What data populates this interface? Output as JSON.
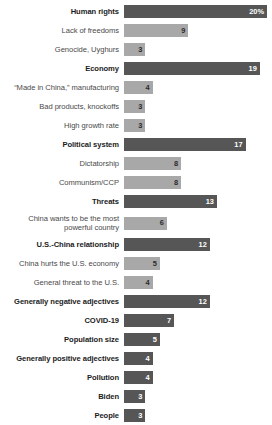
{
  "chart_data": {
    "type": "bar",
    "title": "",
    "subtitle": "",
    "xlabel": "",
    "ylabel": "",
    "orientation": "horizontal",
    "grid": false,
    "legend": null,
    "xlim": [
      0,
      20
    ],
    "value_suffix_first": "%",
    "colors": {
      "major_bar": "#565656",
      "minor_bar": "#a8a8a8",
      "major_label": "#1c1c1c",
      "minor_label": "#4a4a4a",
      "major_value_text": "#ffffff",
      "minor_value_text": "#2b2b2b",
      "background": "#ffffff"
    },
    "categories": [
      "Human rights",
      "Lack of freedoms",
      "Genocide, Uyghurs",
      "Economy",
      "“Made in China,” manufacturing",
      "Bad products, knockoffs",
      "High growth rate",
      "Political system",
      "Dictatorship",
      "Communism/CCP",
      "Threats",
      "China wants to be the most\npowerful country",
      "U.S.-China relationship",
      "China hurts the U.S. economy",
      "General threat to the U.S.",
      "Generally negative adjectives",
      "COVID-19",
      "Population size",
      "Generally positive adjectives",
      "Pollution",
      "Biden",
      "People"
    ],
    "values": [
      20,
      9,
      3,
      19,
      4,
      3,
      3,
      17,
      8,
      8,
      13,
      6,
      12,
      5,
      4,
      12,
      7,
      5,
      4,
      4,
      3,
      3
    ],
    "rows": [
      {
        "label": "Human rights",
        "value": 20,
        "display": "20%",
        "emphasis": "major",
        "tall": false
      },
      {
        "label": "Lack of freedoms",
        "value": 9,
        "display": "9",
        "emphasis": "minor",
        "tall": false
      },
      {
        "label": "Genocide, Uyghurs",
        "value": 3,
        "display": "3",
        "emphasis": "minor",
        "tall": false
      },
      {
        "label": "Economy",
        "value": 19,
        "display": "19",
        "emphasis": "major",
        "tall": false
      },
      {
        "label": "“Made in China,” manufacturing",
        "value": 4,
        "display": "4",
        "emphasis": "minor",
        "tall": false
      },
      {
        "label": "Bad products, knockoffs",
        "value": 3,
        "display": "3",
        "emphasis": "minor",
        "tall": false
      },
      {
        "label": "High growth rate",
        "value": 3,
        "display": "3",
        "emphasis": "minor",
        "tall": false
      },
      {
        "label": "Political system",
        "value": 17,
        "display": "17",
        "emphasis": "major",
        "tall": false
      },
      {
        "label": "Dictatorship",
        "value": 8,
        "display": "8",
        "emphasis": "minor",
        "tall": false
      },
      {
        "label": "Communism/CCP",
        "value": 8,
        "display": "8",
        "emphasis": "minor",
        "tall": false
      },
      {
        "label": "Threats",
        "value": 13,
        "display": "13",
        "emphasis": "major",
        "tall": false
      },
      {
        "label": "China wants to be the most\npowerful country",
        "value": 6,
        "display": "6",
        "emphasis": "minor",
        "tall": true
      },
      {
        "label": "U.S.-China relationship",
        "value": 12,
        "display": "12",
        "emphasis": "major",
        "tall": false
      },
      {
        "label": "China hurts the U.S. economy",
        "value": 5,
        "display": "5",
        "emphasis": "minor",
        "tall": false
      },
      {
        "label": "General threat to the U.S.",
        "value": 4,
        "display": "4",
        "emphasis": "minor",
        "tall": false
      },
      {
        "label": "Generally negative adjectives",
        "value": 12,
        "display": "12",
        "emphasis": "major",
        "tall": false
      },
      {
        "label": "COVID-19",
        "value": 7,
        "display": "7",
        "emphasis": "major",
        "tall": false
      },
      {
        "label": "Population size",
        "value": 5,
        "display": "5",
        "emphasis": "major",
        "tall": false
      },
      {
        "label": "Generally positive adjectives",
        "value": 4,
        "display": "4",
        "emphasis": "major",
        "tall": false
      },
      {
        "label": "Pollution",
        "value": 4,
        "display": "4",
        "emphasis": "major",
        "tall": false
      },
      {
        "label": "Biden",
        "value": 3,
        "display": "3",
        "emphasis": "major",
        "tall": false
      },
      {
        "label": "People",
        "value": 3,
        "display": "3",
        "emphasis": "major",
        "tall": false
      }
    ]
  }
}
